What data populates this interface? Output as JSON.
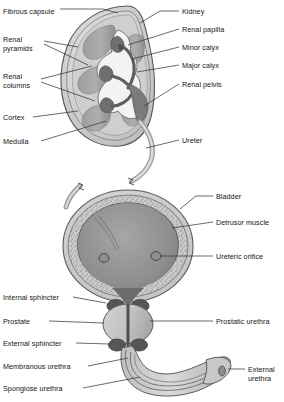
{
  "figure": {
    "style": "grayscale line-and-tone anatomical illustration",
    "panels": [
      {
        "name": "kidney-coronal-section",
        "region": "top"
      },
      {
        "name": "bladder-and-urethra-coronal-section",
        "region": "bottom"
      }
    ]
  },
  "colors": {
    "background": "#ffffff",
    "outline": "#3a3a3a",
    "leader_line": "#2b2b2b",
    "capsule_light": "#d9d9d9",
    "cortex": "#c4c4c4",
    "pyramid_mid": "#a8a8a8",
    "pyramid_dark": "#8e8e8e",
    "sinus_white": "#f2f2f2",
    "calyx_dark": "#6e6e6e",
    "detrusor_speckle": "#bdbdbd",
    "lumen_dark": "#8a8a8a",
    "sphincter_dark": "#575757",
    "text": "#141414"
  },
  "kidney_labels": {
    "left": [
      {
        "id": "fibrous-capsule",
        "text": "Fibrous capsule",
        "x": 3,
        "y": 11
      },
      {
        "id": "renal-pyramids",
        "text": "Renal\npyramids",
        "x": 3,
        "y": 39
      },
      {
        "id": "renal-columns",
        "text": "Renal\ncolumns",
        "x": 3,
        "y": 76
      },
      {
        "id": "cortex",
        "text": "Cortex",
        "x": 3,
        "y": 114
      },
      {
        "id": "medulla",
        "text": "Medulla",
        "x": 3,
        "y": 138
      }
    ],
    "right": [
      {
        "id": "kidney",
        "text": "Kidney",
        "x": 182,
        "y": 8
      },
      {
        "id": "renal-papilla",
        "text": "Renal papilla",
        "x": 182,
        "y": 26
      },
      {
        "id": "minor-calyx",
        "text": "Minor calyx",
        "x": 182,
        "y": 44
      },
      {
        "id": "major-calyx",
        "text": "Major calyx",
        "x": 182,
        "y": 62
      },
      {
        "id": "renal-pelvis",
        "text": "Renal pelvis",
        "x": 182,
        "y": 81
      },
      {
        "id": "ureter",
        "text": "Ureter",
        "x": 182,
        "y": 137
      }
    ]
  },
  "bladder_labels": {
    "right": [
      {
        "id": "bladder",
        "text": "Bladder",
        "x": 216,
        "y": 193
      },
      {
        "id": "detrusor-muscle",
        "text": "Detrusor muscle",
        "x": 216,
        "y": 219
      },
      {
        "id": "ureteric-orifice",
        "text": "Ureteric orifice",
        "x": 216,
        "y": 253
      },
      {
        "id": "prostatic-urethra",
        "text": "Prostatic urethra",
        "x": 216,
        "y": 318
      },
      {
        "id": "external-urethra",
        "text": "External\nurethra",
        "x": 248,
        "y": 366
      }
    ],
    "left": [
      {
        "id": "internal-sphincter",
        "text": "Internal sphincter",
        "x": 3,
        "y": 294
      },
      {
        "id": "prostate",
        "text": "Prostate",
        "x": 3,
        "y": 318
      },
      {
        "id": "external-sphincter",
        "text": "External sphincter",
        "x": 3,
        "y": 340
      },
      {
        "id": "membranous-urethra",
        "text": "Membranous urethra",
        "x": 3,
        "y": 363
      },
      {
        "id": "spongiose-urethra",
        "text": "Spongiose urethra",
        "x": 3,
        "y": 385
      }
    ]
  }
}
